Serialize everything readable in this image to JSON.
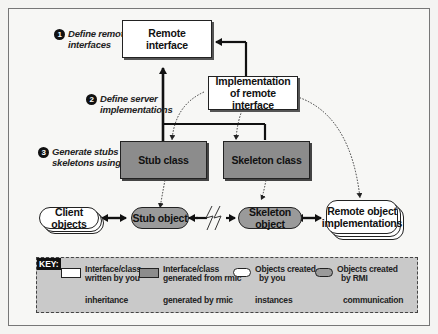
{
  "diagram": {
    "steps": [
      {
        "number": "1",
        "text_line1": "Define remote",
        "text_line2": "interfaces"
      },
      {
        "number": "2",
        "text_line1": "Define server",
        "text_line2": "implementations"
      },
      {
        "number": "3",
        "text_line1": "Generate stubs and",
        "text_line2": "skeletons using rmic"
      }
    ],
    "nodes": {
      "remote_interface": {
        "line1": "Remote",
        "line2": "interface"
      },
      "implementation": {
        "line1": "Implementation",
        "line2": "of remote interface"
      },
      "stub_class": {
        "label": "Stub class"
      },
      "skeleton_class": {
        "label": "Skeleton class"
      },
      "client_objects": {
        "label": "Client objects"
      },
      "stub_object": {
        "label": "Stub object"
      },
      "skeleton_object": {
        "label": "Skeleton object"
      },
      "remote_impl": {
        "line1": "Remote object",
        "line2": "implementations"
      }
    },
    "colors": {
      "written_by_you": "#ffffff",
      "generated": "#8c8c8c",
      "key_background": "#c9c9c9",
      "line": "#111111"
    }
  },
  "key": {
    "title": "KEY:",
    "items": [
      {
        "line1": "Interface/class",
        "line2": "written by you"
      },
      {
        "line1": "Interface/class",
        "line2": "generated from rmic"
      },
      {
        "line1": "Objects created",
        "line2": "by you"
      },
      {
        "line1": "Objects created",
        "line2": "by RMI"
      }
    ],
    "arrows": [
      {
        "label": "inheritance"
      },
      {
        "label": "generated by rmic"
      },
      {
        "label": "instances"
      },
      {
        "label": "communication"
      }
    ]
  }
}
